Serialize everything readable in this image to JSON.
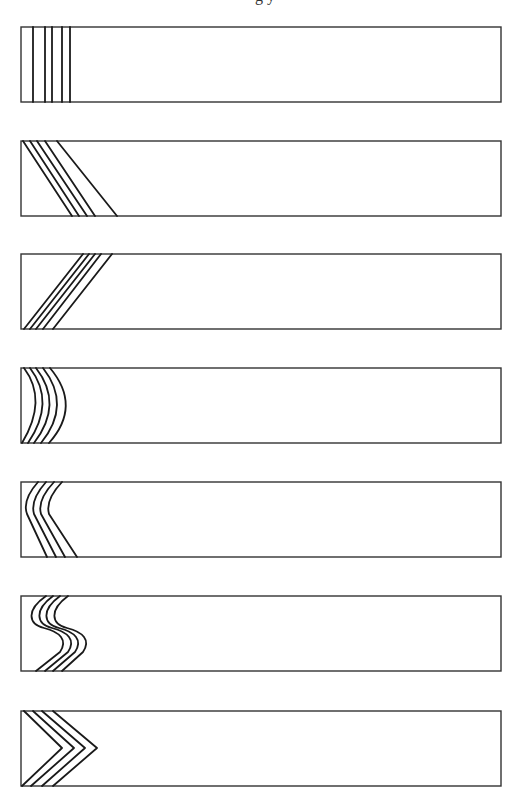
{
  "figure": {
    "caption_cut_text": "g                                        y",
    "stroke_color": "#1a1a1a",
    "box_color": "#333333",
    "background": "#ffffff",
    "panels": [
      {
        "id": "panel-1",
        "pattern": "vertical-lines",
        "box": {
          "x": 21,
          "y": 27,
          "w": 480,
          "h": 75
        },
        "line_count": 5
      },
      {
        "id": "panel-2",
        "pattern": "diagonal-down-right",
        "box": {
          "x": 21,
          "y": 141,
          "w": 480,
          "h": 75
        },
        "line_count": 5
      },
      {
        "id": "panel-3",
        "pattern": "diagonal-up-right",
        "box": {
          "x": 21,
          "y": 254,
          "w": 480,
          "h": 75
        },
        "line_count": 5
      },
      {
        "id": "panel-4",
        "pattern": "convex-arcs",
        "box": {
          "x": 21,
          "y": 368,
          "w": 480,
          "h": 75
        },
        "line_count": 5
      },
      {
        "id": "panel-5",
        "pattern": "bent-lines-left",
        "box": {
          "x": 21,
          "y": 482,
          "w": 480,
          "h": 75
        },
        "line_count": 4
      },
      {
        "id": "panel-6",
        "pattern": "s-curves",
        "box": {
          "x": 21,
          "y": 596,
          "w": 480,
          "h": 75
        },
        "line_count": 4
      },
      {
        "id": "panel-7",
        "pattern": "chevrons-right",
        "box": {
          "x": 21,
          "y": 711,
          "w": 480,
          "h": 75
        },
        "line_count": 4
      }
    ]
  }
}
